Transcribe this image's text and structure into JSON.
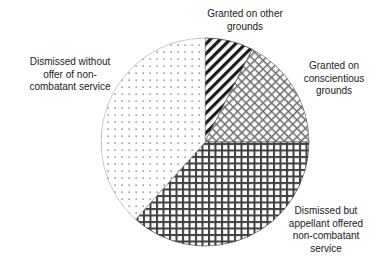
{
  "chart_data": {
    "type": "pie",
    "title": "",
    "subtitle": "",
    "xlabel": "",
    "ylabel": "",
    "grid": false,
    "legend_position": "none",
    "labels_position": "outside",
    "start_angle_deg": 0,
    "direction": "clockwise",
    "center_px": [
      205,
      142
    ],
    "radius_px": 104,
    "categories": [
      "Granted on other grounds",
      "Granted on conscientious grounds",
      "Dismissed but appellant offered non-combatant service",
      "Dismissed without offer of non-combatant service"
    ],
    "values": [
      7.5,
      17.5,
      36.7,
      38.3
    ],
    "slices": [
      {
        "label": "Granted on other grounds",
        "label_lines": "Granted on other\ngrounds",
        "value": 7.5,
        "start_angle_deg": 0,
        "end_angle_deg": 27,
        "pattern": "diagonal-hatch",
        "fill": "#ffffff",
        "stroke": "#1a1a1a"
      },
      {
        "label": "Granted on conscientious grounds",
        "label_lines": "Granted on\nconscientious\ngrounds",
        "value": 17.5,
        "start_angle_deg": 27,
        "end_angle_deg": 90,
        "pattern": "fine-crosshatch",
        "fill": "#ffffff",
        "stroke": "#6a6a6a"
      },
      {
        "label": "Dismissed but appellant offered non-combatant service",
        "label_lines": "Dismissed but\nappellant offered\nnon-combatant\nservice",
        "value": 36.7,
        "start_angle_deg": 90,
        "end_angle_deg": 222,
        "pattern": "bold-crosshatch",
        "fill": "#ffffff",
        "stroke": "#3a3a3a"
      },
      {
        "label": "Dismissed without offer of non-combatant service",
        "label_lines": "Dismissed without\noffer of non-\ncombatant service",
        "value": 38.3,
        "start_angle_deg": 222,
        "end_angle_deg": 360,
        "pattern": "fine-dots",
        "fill": "#ffffff",
        "stroke": "#9a9a9a"
      }
    ],
    "colors": {
      "background": "#ffffff",
      "text": "#1a1a1a",
      "outline": "#555555"
    }
  }
}
